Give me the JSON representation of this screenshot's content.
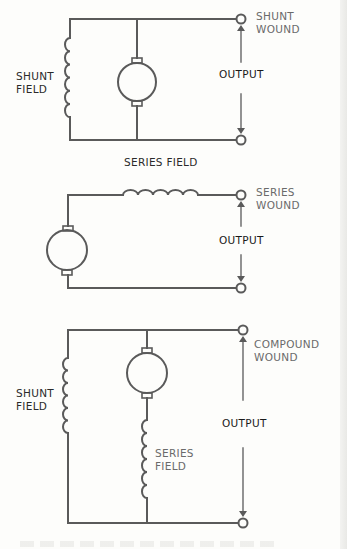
{
  "diagrams": [
    {
      "id": "shunt",
      "type_label": "SHUNT\nWOUND",
      "output_label": "OUTPUT",
      "field_labels": [
        "SHUNT\nFIELD"
      ]
    },
    {
      "id": "series",
      "type_label": "SERIES\nWOUND",
      "output_label": "OUTPUT",
      "field_labels": [
        "SERIES FIELD"
      ]
    },
    {
      "id": "compound",
      "type_label": "COMPOUND\nWOUND",
      "output_label": "OUTPUT",
      "field_labels": [
        "SHUNT\nFIELD",
        "SERIES\nFIELD"
      ]
    }
  ],
  "colors": {
    "line": "#5a5a5a",
    "text": "#2a2a2a",
    "background": "#fdfdfb"
  }
}
